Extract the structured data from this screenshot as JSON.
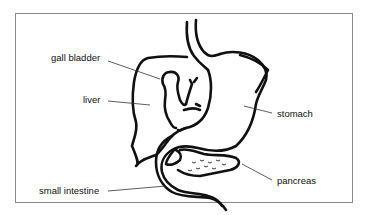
{
  "diagram": {
    "type": "anatomy-labeled-illustration",
    "labels": {
      "gall_bladder": "gall bladder",
      "liver": "liver",
      "stomach": "stomach",
      "pancreas": "pancreas",
      "small_intestine": "small intestine"
    },
    "colors": {
      "stroke": "#111111",
      "frame": "#8a8a8a",
      "background": "#ffffff"
    }
  }
}
